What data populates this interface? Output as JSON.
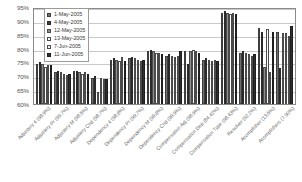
{
  "chart_data": {
    "type": "bar",
    "title": "",
    "xlabel": "",
    "ylabel": "",
    "ylim": [
      0.6,
      0.95
    ],
    "ytick_labels": [
      "95%",
      "90%",
      "85%",
      "80%",
      "75%",
      "70%",
      "65%",
      "60%"
    ],
    "ytick_values": [
      0.95,
      0.9,
      0.85,
      0.8,
      0.75,
      0.7,
      0.65,
      0.6
    ],
    "grid": true,
    "legend_position": "top-left",
    "categories": [
      "Adjustery 4 (98.9%)",
      "Adjustery Pr (99.7%)",
      "Adjustery M (98.5%)",
      "Adjustery Cnd (98.7%)",
      "Dependency 4 (98.8%)",
      "Dependency Pr (99.7%)",
      "Dependency M (99.8%)",
      "Dependency Cnd (99.9%)",
      "Compensation Adj (98.9%)",
      "Compensation Dep (84.42%)",
      "Compensation Type (98.43%)",
      "Resolver (92.2%)",
      "Acomplisher (13.5%)",
      "Acomplishers (7.90%)"
    ],
    "series": [
      {
        "name": "1-May-2005",
        "values": [
          0.745,
          0.715,
          0.72,
          0.695,
          0.76,
          0.765,
          0.79,
          0.775,
          0.79,
          0.76,
          0.93,
          0.785,
          0.875,
          0.86
        ]
      },
      {
        "name": "4-May-2005",
        "values": [
          0.75,
          0.72,
          0.72,
          0.7,
          0.765,
          0.77,
          0.795,
          0.78,
          0.745,
          0.765,
          0.935,
          0.79,
          0.86,
          0.73
        ]
      },
      {
        "name": "12-May-2005",
        "values": [
          0.745,
          0.715,
          0.715,
          0.645,
          0.76,
          0.765,
          0.79,
          0.775,
          0.79,
          0.76,
          0.93,
          0.785,
          0.735,
          0.855
        ]
      },
      {
        "name": "13-May-2005",
        "values": [
          0.735,
          0.71,
          0.71,
          0.695,
          0.755,
          0.76,
          0.785,
          0.77,
          0.795,
          0.755,
          0.925,
          0.78,
          0.87,
          0.855
        ]
      },
      {
        "name": "7-Jun-2005",
        "values": [
          0.74,
          0.705,
          0.715,
          0.69,
          0.77,
          0.755,
          0.785,
          0.775,
          0.79,
          0.76,
          0.93,
          0.775,
          0.715,
          0.845
        ]
      },
      {
        "name": "11-Jun-2005",
        "values": [
          0.74,
          0.71,
          0.71,
          0.69,
          0.755,
          0.76,
          0.78,
          0.79,
          0.785,
          0.755,
          0.925,
          0.78,
          0.86,
          0.88
        ]
      }
    ]
  }
}
